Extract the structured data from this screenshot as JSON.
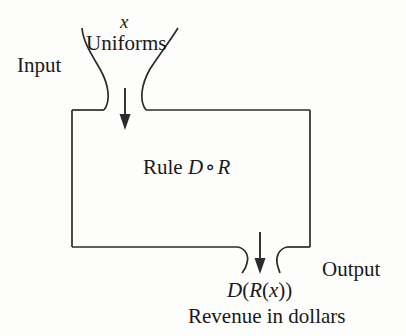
{
  "diagram": {
    "type": "function-machine-flow",
    "background_color": "#fdfdfc",
    "line_color": "#2b2b2b",
    "text_color": "#1a1a1a",
    "input": {
      "variable": "x",
      "variable_style": "italic",
      "description": "Uniforms",
      "side_label": "Input"
    },
    "machine": {
      "rule_prefix": "Rule",
      "rule_first": "D",
      "rule_operator": "∘",
      "rule_second": "R",
      "rule_full": "Rule D ∘ R"
    },
    "output": {
      "expression": "D(R(x))",
      "expression_left": "D",
      "paren_open_1": "(",
      "expression_inner": "R",
      "paren_open_2": "(",
      "expression_arg": "x",
      "paren_close_1": ")",
      "paren_close_2": ")",
      "description": "Revenue in dollars",
      "side_label": "Output"
    },
    "arrows": {
      "input_arrow_direction": "down",
      "output_arrow_direction": "down"
    }
  }
}
